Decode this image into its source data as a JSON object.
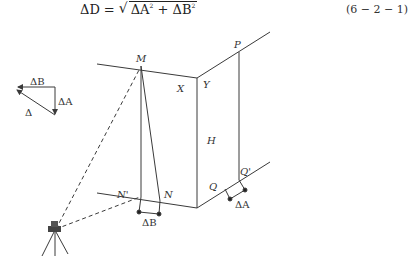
{
  "formula": {
    "lhs": "ΔD",
    "equals": "=",
    "radicand_a": "ΔA",
    "plus": " + ",
    "radicand_b": "ΔB",
    "exp": "2",
    "equation_number": "(6 − 2 − 1)"
  },
  "vector_diagram": {
    "label_top": "ΔB",
    "label_right": "ΔA",
    "label_hyp": "Δ"
  },
  "main_diagram": {
    "points": {
      "M": "M",
      "X": "X",
      "Y": "Y",
      "P": "P",
      "H": "H",
      "N_prime": "N'",
      "N": "N",
      "Q": "Q",
      "Q_prime": "Q'"
    },
    "offset_labels": {
      "bottom_left": "ΔB",
      "bottom_right": "ΔA"
    }
  },
  "colors": {
    "line": "#3a3a3a",
    "text": "#333333",
    "background": "#ffffff"
  }
}
